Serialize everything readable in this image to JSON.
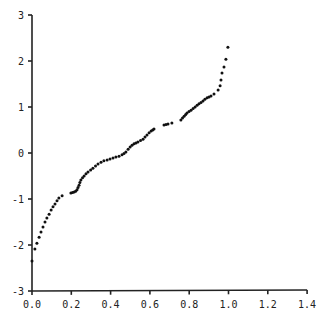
{
  "chart_data": {
    "type": "scatter",
    "title": "",
    "xlabel": "",
    "ylabel": "",
    "xlim": [
      0.0,
      1.4
    ],
    "ylim": [
      -3,
      3
    ],
    "grid": false,
    "legend": null,
    "x_ticks": [
      "0.0",
      "0.2",
      "0.4",
      "0.6",
      "0.8",
      "1.0",
      "1.2",
      "1.4"
    ],
    "y_ticks": [
      "3",
      "2",
      "1",
      "0",
      "-1",
      "-2",
      "-3"
    ],
    "series": [
      {
        "name": "points",
        "color": "#111111",
        "x": [
          0.0,
          0.015,
          0.025,
          0.036,
          0.046,
          0.056,
          0.066,
          0.076,
          0.087,
          0.097,
          0.107,
          0.117,
          0.127,
          0.137,
          0.153,
          0.198,
          0.206,
          0.214,
          0.222,
          0.229,
          0.234,
          0.239,
          0.244,
          0.249,
          0.257,
          0.265,
          0.275,
          0.285,
          0.298,
          0.31,
          0.323,
          0.336,
          0.351,
          0.366,
          0.382,
          0.397,
          0.412,
          0.427,
          0.443,
          0.458,
          0.468,
          0.478,
          0.489,
          0.499,
          0.509,
          0.519,
          0.529,
          0.539,
          0.552,
          0.565,
          0.575,
          0.585,
          0.596,
          0.606,
          0.614,
          0.621,
          0.672,
          0.682,
          0.692,
          0.712,
          0.758,
          0.766,
          0.774,
          0.782,
          0.789,
          0.799,
          0.809,
          0.82,
          0.83,
          0.84,
          0.85,
          0.86,
          0.87,
          0.88,
          0.891,
          0.901,
          0.911,
          0.926,
          0.947,
          0.957,
          0.962,
          0.967,
          0.977,
          0.987,
          0.997
        ],
        "y": [
          -2.35,
          -2.09,
          -1.96,
          -1.83,
          -1.72,
          -1.61,
          -1.5,
          -1.41,
          -1.33,
          -1.24,
          -1.17,
          -1.11,
          -1.04,
          -0.98,
          -0.93,
          -0.87,
          -0.86,
          -0.85,
          -0.83,
          -0.8,
          -0.75,
          -0.7,
          -0.64,
          -0.59,
          -0.54,
          -0.5,
          -0.45,
          -0.41,
          -0.37,
          -0.33,
          -0.28,
          -0.24,
          -0.2,
          -0.17,
          -0.15,
          -0.13,
          -0.11,
          -0.09,
          -0.07,
          -0.04,
          -0.01,
          0.02,
          0.08,
          0.13,
          0.17,
          0.2,
          0.22,
          0.24,
          0.27,
          0.3,
          0.35,
          0.39,
          0.44,
          0.48,
          0.5,
          0.52,
          0.61,
          0.62,
          0.63,
          0.65,
          0.72,
          0.76,
          0.8,
          0.84,
          0.87,
          0.9,
          0.93,
          0.97,
          1.0,
          1.04,
          1.07,
          1.1,
          1.13,
          1.17,
          1.2,
          1.22,
          1.24,
          1.28,
          1.37,
          1.46,
          1.59,
          1.74,
          1.87,
          2.04,
          2.3
        ]
      }
    ]
  }
}
